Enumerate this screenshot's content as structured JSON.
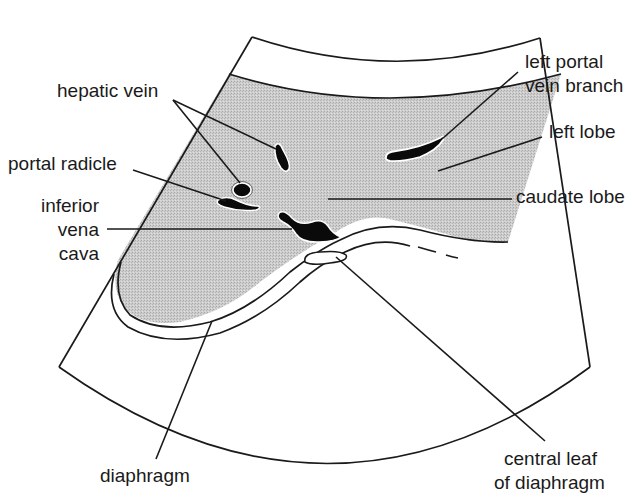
{
  "diagram": {
    "colors": {
      "liver_fill": "#c4c4c4",
      "vessel_fill": "#0a0a0a",
      "line": "#1a1a1a",
      "background": "#ffffff"
    },
    "labels": {
      "hepatic_vein": "hepatic vein",
      "portal_radicle": "portal radicle",
      "ivc_line1": "inferior",
      "ivc_line2": "vena",
      "ivc_line3": "cava",
      "left_portal_line1": "left portal",
      "left_portal_line2": "vein branch",
      "left_lobe": "left lobe",
      "caudate_lobe": "caudate lobe",
      "diaphragm": "diaphragm",
      "central_leaf_line1": "central leaf",
      "central_leaf_line2": "of diaphragm"
    }
  }
}
